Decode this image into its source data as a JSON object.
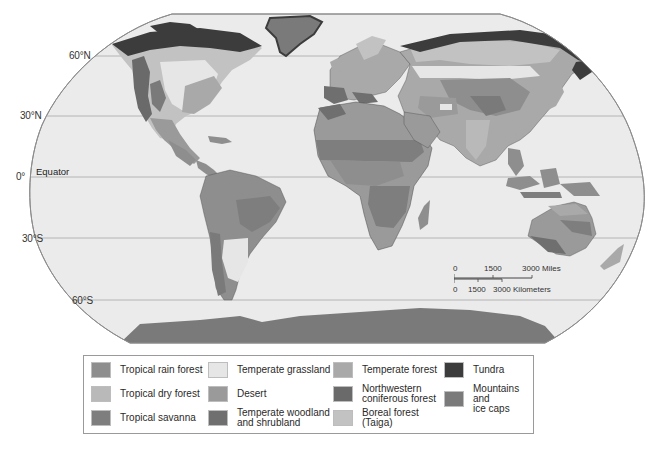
{
  "map": {
    "latitude_labels": [
      {
        "label": "60°N",
        "y": 56
      },
      {
        "label": "30°N",
        "y": 116
      },
      {
        "label": "0°",
        "y": 177
      },
      {
        "label": "30°S",
        "y": 238
      },
      {
        "label": "60°S",
        "y": 300
      }
    ],
    "equator_label": "Equator",
    "colors": {
      "ocean": "#ebebeb",
      "outline": "#8c8c8c",
      "gridline": "#a6a6a6",
      "border": "#4a4a4a"
    }
  },
  "scale_bar": {
    "miles": {
      "ticks": [
        "0",
        "1500",
        "3000 Miles"
      ]
    },
    "kilometers": {
      "ticks": [
        "0",
        "1500",
        "3000 Kilometers"
      ]
    }
  },
  "legend": {
    "items": [
      {
        "label": "Tropical rain forest",
        "color": "#8e8e8e"
      },
      {
        "label": "Tropical dry forest",
        "color": "#b9b9b9"
      },
      {
        "label": "Tropical savanna",
        "color": "#7e7e7e"
      },
      {
        "label": "Temperate grassland",
        "color": "#e6e6e6"
      },
      {
        "label": "Desert",
        "color": "#9a9a9a"
      },
      {
        "label": "Temperate woodland\nand shrubland",
        "color": "#6f6f6f"
      },
      {
        "label": "Temperate forest",
        "color": "#a9a9a9"
      },
      {
        "label": "Northwestern\nconiferous forest",
        "color": "#6a6a6a"
      },
      {
        "label": "Boreal forest\n(Taiga)",
        "color": "#c2c2c2"
      },
      {
        "label": "Tundra",
        "color": "#3c3c3c"
      },
      {
        "label": "Mountains and\nice caps",
        "color": "#7a7a7a"
      }
    ]
  }
}
